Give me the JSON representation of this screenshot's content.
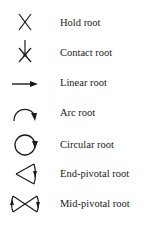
{
  "legend": {
    "items": [
      {
        "icon": "hold-root-icon",
        "label": "Hold root"
      },
      {
        "icon": "contact-root-icon",
        "label": "Contact root"
      },
      {
        "icon": "linear-root-icon",
        "label": "Linear root"
      },
      {
        "icon": "arc-root-icon",
        "label": "Arc root"
      },
      {
        "icon": "circular-root-icon",
        "label": "Circular root"
      },
      {
        "icon": "end-pivotal-root-icon",
        "label": "End-pivotal root"
      },
      {
        "icon": "mid-pivotal-root-icon",
        "label": "Mid-pivotal root"
      }
    ]
  }
}
